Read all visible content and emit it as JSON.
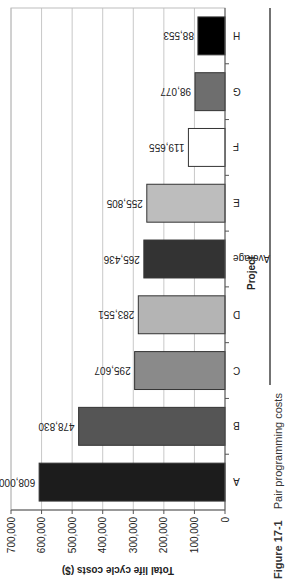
{
  "chart_data": {
    "type": "bar",
    "title": "Pair programming costs",
    "figure_label": "Figure 17-1",
    "xlabel": "Project",
    "ylabel": "Total life cycle costs ($)",
    "categories": [
      "A",
      "B",
      "C",
      "D",
      "Average",
      "E",
      "F",
      "G",
      "H"
    ],
    "values": [
      608000,
      478830,
      295607,
      283551,
      265436,
      255805,
      119655,
      98077,
      88553
    ],
    "value_labels": [
      "608,000",
      "478,830",
      "295,607",
      "283,551",
      "265,436",
      "255,805",
      "119,655",
      "98,077",
      "88,553"
    ],
    "bar_colors": [
      "#1c1c1c",
      "#555555",
      "#8a8a8a",
      "#b4b4b4",
      "#333333",
      "#bdbdbd",
      "#ffffff",
      "#6e6e6e",
      "#000000"
    ],
    "ylim": [
      0,
      700000
    ],
    "yticks": [
      0,
      100000,
      200000,
      300000,
      400000,
      500000,
      600000,
      700000
    ],
    "ytick_labels": [
      "0",
      "100,000",
      "200,000",
      "300,000",
      "400,000",
      "500,000",
      "600,000",
      "700,000"
    ],
    "grid": true,
    "legend": "none",
    "orientation": "image rotated 90° counter-clockwise"
  }
}
